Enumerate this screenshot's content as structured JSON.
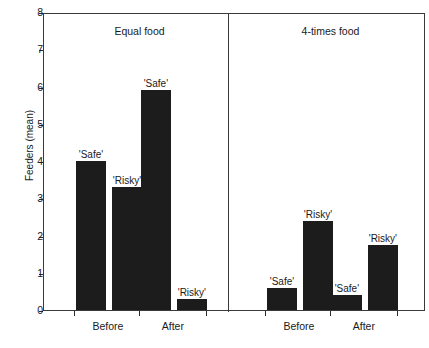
{
  "chart_data": {
    "type": "bar",
    "title": "",
    "xlabel": "",
    "ylabel": "Feeders (mean)",
    "ylim": [
      0,
      8
    ],
    "ytick_labels": [
      "0",
      "1",
      "2",
      "3",
      "4",
      "5",
      "6",
      "7",
      "8"
    ],
    "grid": false,
    "legend_position": "none",
    "panels": [
      {
        "title": "Equal food",
        "groups": [
          {
            "label": "Before",
            "bars": [
              {
                "label": "'Safe'",
                "value": 4.0
              },
              {
                "label": "'Risky'",
                "value": 3.3
              }
            ]
          },
          {
            "label": "After",
            "bars": [
              {
                "label": "'Safe'",
                "value": 5.9
              },
              {
                "label": "'Risky'",
                "value": 0.3
              }
            ]
          }
        ]
      },
      {
        "title": "4-times food",
        "groups": [
          {
            "label": "Before",
            "bars": [
              {
                "label": "'Safe'",
                "value": 0.6
              },
              {
                "label": "'Risky'",
                "value": 2.4
              }
            ]
          },
          {
            "label": "After",
            "bars": [
              {
                "label": "'Safe'",
                "value": 0.4
              },
              {
                "label": "'Risky'",
                "value": 1.75
              }
            ]
          }
        ]
      }
    ],
    "colors": {
      "bar_fill": "#1c1c1c",
      "axis": "#3a3a3a",
      "text": "#1a1a1a",
      "background": "#ffffff"
    }
  }
}
